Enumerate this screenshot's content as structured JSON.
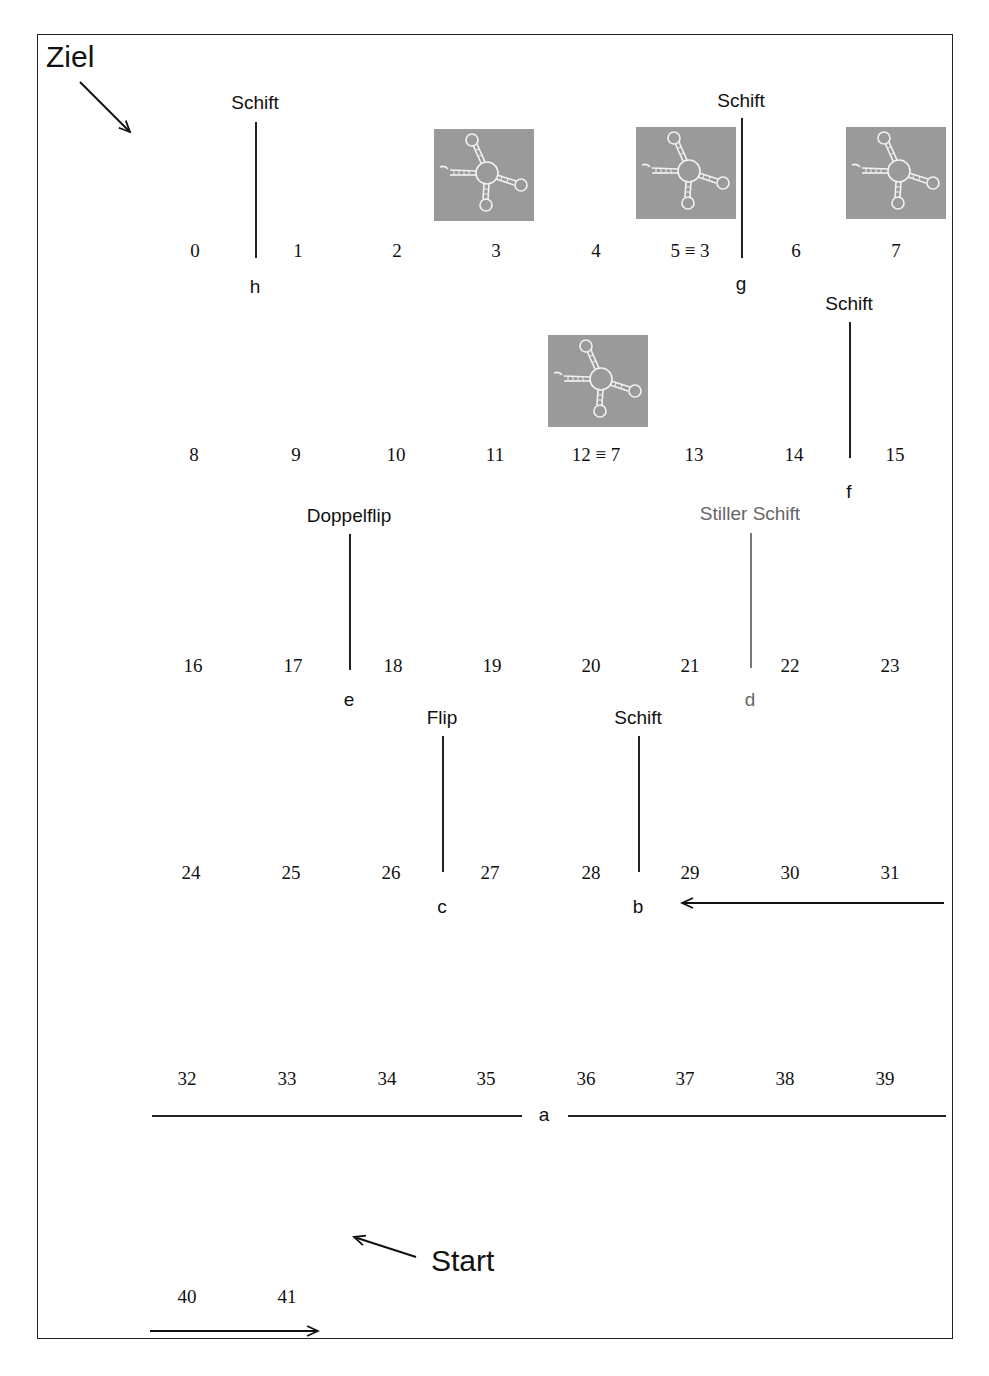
{
  "title_target": "Ziel",
  "title_start": "Start",
  "colors": {
    "line": "#222222",
    "muted": "#666666",
    "rna_bg": "#9a9a9a"
  },
  "rows": [
    {
      "y": 240,
      "cells": [
        "0",
        "1",
        "2",
        "3",
        "4",
        "5 ≡ 3",
        "6",
        "7"
      ],
      "x": [
        195,
        298,
        397,
        496,
        596,
        690,
        796,
        896
      ]
    },
    {
      "y": 444,
      "cells": [
        "8",
        "9",
        "10",
        "11",
        "12 ≡ 7",
        "13",
        "14",
        "15"
      ],
      "x": [
        194,
        296,
        396,
        495,
        596,
        694,
        794,
        895
      ]
    },
    {
      "y": 655,
      "cells": [
        "16",
        "17",
        "18",
        "19",
        "20",
        "21",
        "22",
        "23"
      ],
      "x": [
        193,
        293,
        393,
        492,
        591,
        690,
        790,
        890
      ]
    },
    {
      "y": 862,
      "cells": [
        "24",
        "25",
        "26",
        "27",
        "28",
        "29",
        "30",
        "31"
      ],
      "x": [
        191,
        291,
        391,
        490,
        591,
        690,
        790,
        890
      ]
    },
    {
      "y": 1068,
      "cells": [
        "32",
        "33",
        "34",
        "35",
        "36",
        "37",
        "38",
        "39"
      ],
      "x": [
        187,
        287,
        387,
        486,
        586,
        685,
        785,
        885
      ]
    },
    {
      "y": 1286,
      "cells": [
        "40",
        "41"
      ],
      "x": [
        187,
        287
      ]
    }
  ],
  "transitions": [
    {
      "id": "h",
      "label": "Schift",
      "x": 255,
      "label_y": 92,
      "line_top": 122,
      "line_bottom": 258,
      "letter_y": 276,
      "muted": false
    },
    {
      "id": "g",
      "label": "Schift",
      "x": 741,
      "label_y": 90,
      "line_top": 118,
      "line_bottom": 258,
      "letter_y": 273,
      "muted": false
    },
    {
      "id": "f",
      "label": "Schift",
      "x": 849,
      "label_y": 293,
      "line_top": 322,
      "line_bottom": 458,
      "letter_y": 481,
      "muted": false
    },
    {
      "id": "e",
      "label": "Doppelflip",
      "x": 349,
      "label_y": 505,
      "line_top": 534,
      "line_bottom": 670,
      "letter_y": 689,
      "muted": false
    },
    {
      "id": "d",
      "label": "Stiller Schift",
      "x": 750,
      "label_y": 503,
      "line_top": 533,
      "line_bottom": 668,
      "letter_y": 689,
      "muted": true
    },
    {
      "id": "c",
      "label": "Flip",
      "x": 442,
      "label_y": 707,
      "line_top": 736,
      "line_bottom": 872,
      "letter_y": 896,
      "muted": false
    },
    {
      "id": "b",
      "label": "Schift",
      "x": 638,
      "label_y": 707,
      "line_top": 736,
      "line_bottom": 872,
      "letter_y": 896,
      "muted": false
    }
  ],
  "horizontal_marker": {
    "id": "a",
    "y": 1116,
    "letter_x": 544
  },
  "rna_structures": [
    {
      "name": "structure-3",
      "x": 434,
      "y": 129
    },
    {
      "name": "structure-5",
      "x": 636,
      "y": 127
    },
    {
      "name": "structure-7",
      "x": 846,
      "y": 127
    },
    {
      "name": "structure-12",
      "x": 548,
      "y": 335
    }
  ]
}
